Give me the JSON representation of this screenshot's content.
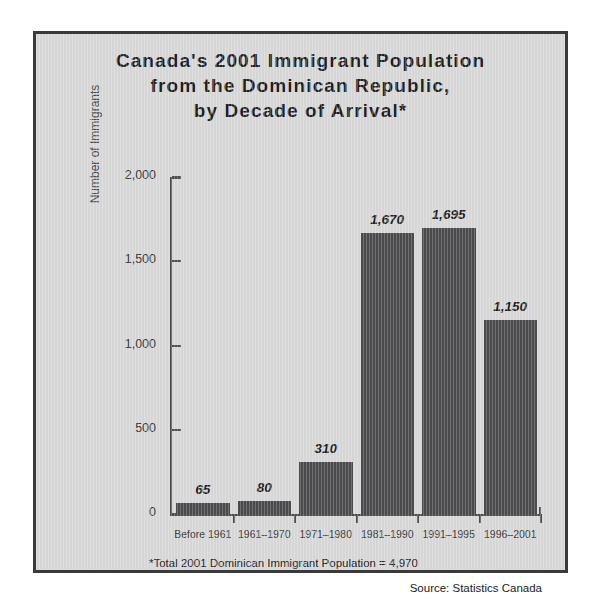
{
  "chart_data": {
    "type": "bar",
    "title": "Canada's 2001 Immigrant Population from the Dominican Republic, by Decade of Arrival*",
    "title_lines": [
      "Canada's 2001 Immigrant Population",
      "from the Dominican Republic,",
      "by Decade of Arrival*"
    ],
    "categories": [
      "Before 1961",
      "1961–1970",
      "1971–1980",
      "1981–1990",
      "1991–1995",
      "1996–2001"
    ],
    "values": [
      65,
      80,
      310,
      1670,
      1695,
      1150
    ],
    "value_labels": [
      "65",
      "80",
      "310",
      "1,670",
      "1,695",
      "1,150"
    ],
    "xlabel": "",
    "ylabel": "Number of Immigrants",
    "ylim": [
      0,
      2000
    ],
    "yticks": [
      0,
      500,
      1000,
      1500,
      2000
    ],
    "ytick_labels": [
      "0",
      "500",
      "1,000",
      "1,500",
      "2,000"
    ],
    "grid": false,
    "legend": null,
    "bar_color": "#4a4a4c",
    "plot_background": "#d6d6d6",
    "axis_color": "#4d4d4d",
    "footnote": "*Total 2001 Dominican Immigrant Population = 4,970",
    "source": "Source: Statistics Canada"
  }
}
